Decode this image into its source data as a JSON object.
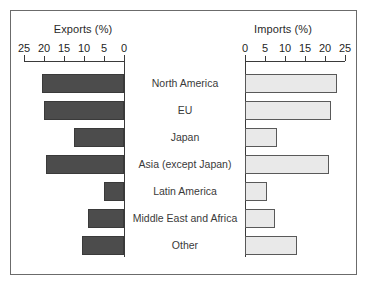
{
  "chart_data": {
    "type": "bar",
    "orientation": "horizontal",
    "layout": "back-to-back pyramid",
    "title": "",
    "categories": [
      "North America",
      "EU",
      "Japan",
      "Asia (except Japan)",
      "Latin America",
      "Middle East and Africa",
      "Other"
    ],
    "series": [
      {
        "name": "Exports (%)",
        "side": "left",
        "direction": "right-to-left",
        "values": [
          20.5,
          20,
          12.5,
          19.5,
          5,
          9,
          10.5
        ],
        "color": "#4c4c4c",
        "axis_label": "Exports (%)",
        "ticks": [
          25,
          20,
          15,
          10,
          5,
          0
        ],
        "xlim": [
          25,
          0
        ]
      },
      {
        "name": "Imports (%)",
        "side": "right",
        "direction": "left-to-right",
        "values": [
          23,
          21.5,
          8,
          21,
          5.5,
          7.5,
          13
        ],
        "color": "#e9e9e9",
        "axis_label": "Imports (%)",
        "ticks": [
          0,
          5,
          10,
          15,
          20,
          25
        ],
        "xlim": [
          0,
          25
        ]
      }
    ],
    "xlabel": "",
    "ylabel": "",
    "grid": false,
    "legend": "none"
  },
  "figure": {
    "exports_title": "Exports (%)",
    "imports_title": "Imports (%)",
    "border_color": "#6b6b6b",
    "background": "#ffffff"
  }
}
